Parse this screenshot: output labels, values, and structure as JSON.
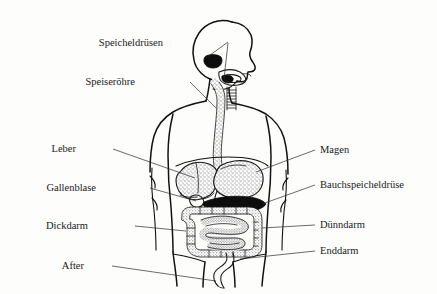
{
  "diagram": {
    "language": "de",
    "style": "black-and-white line drawing, scanned textbook figure",
    "background_color": "#fdfdfc",
    "ink_color": "#1a1a1a",
    "labels_left": [
      {
        "id": "speicheldruesen",
        "text": "Speicheldrüsen",
        "text_x": 163,
        "text_y": 46
      },
      {
        "id": "speiseroehre",
        "text": "Speiseröhre",
        "text_x": 135,
        "text_y": 85
      },
      {
        "id": "leber",
        "text": "Leber",
        "text_x": 76,
        "text_y": 152
      },
      {
        "id": "gallenblase",
        "text": "Gallenblase",
        "text_x": 96,
        "text_y": 191
      },
      {
        "id": "dickdarm",
        "text": "Dickdarm",
        "text_x": 88,
        "text_y": 229
      },
      {
        "id": "after",
        "text": "After",
        "text_x": 84,
        "text_y": 269
      }
    ],
    "labels_right": [
      {
        "id": "magen",
        "text": "Magen",
        "text_x": 320,
        "text_y": 153
      },
      {
        "id": "bauchspeicheldruese",
        "text": "Bauchspeicheldrüse",
        "text_x": 320,
        "text_y": 188
      },
      {
        "id": "duenndarm",
        "text": "Dünndarm",
        "text_x": 320,
        "text_y": 228
      },
      {
        "id": "enddarm",
        "text": "Enddarm",
        "text_x": 320,
        "text_y": 254
      }
    ],
    "organs": [
      {
        "id": "salivary-glands",
        "label": "Speicheldrüsen",
        "shading": "solid black"
      },
      {
        "id": "esophagus",
        "label": "Speiseröhre",
        "shading": "stippled tube"
      },
      {
        "id": "liver",
        "label": "Leber",
        "shading": "stippled"
      },
      {
        "id": "gallbladder",
        "label": "Gallenblase",
        "shading": "outline"
      },
      {
        "id": "stomach",
        "label": "Magen",
        "shading": "stippled"
      },
      {
        "id": "pancreas",
        "label": "Bauchspeicheldrüse",
        "shading": "solid black"
      },
      {
        "id": "large-intestine",
        "label": "Dickdarm",
        "shading": "stippled band"
      },
      {
        "id": "small-intestine",
        "label": "Dünndarm",
        "shading": "stippled coils"
      },
      {
        "id": "rectum",
        "label": "Enddarm",
        "shading": "outline"
      },
      {
        "id": "anus",
        "label": "After",
        "shading": "outline"
      }
    ]
  }
}
